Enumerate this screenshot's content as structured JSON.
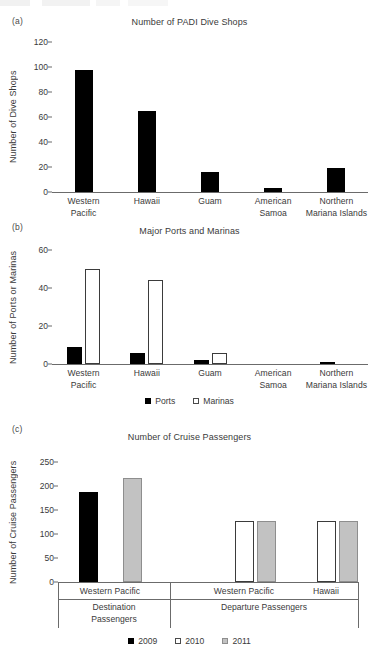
{
  "figure": {
    "panels": [
      {
        "letter": "(a)",
        "title": "Number of PADI Dive Shops",
        "ylabel": "Number of Dive Shops"
      },
      {
        "letter": "(b)",
        "title": "Major Ports and Marinas",
        "ylabel": "Number of Ports or Marinas"
      },
      {
        "letter": "(c)",
        "title": "Number of Cruise Passengers",
        "ylabel": "Number of Cruise Passengers"
      }
    ]
  },
  "chart_data": [
    {
      "panel": "(a)",
      "type": "bar",
      "title": "Number of PADI Dive Shops",
      "xlabel": "",
      "ylabel": "Number of Dive Shops",
      "ylim": [
        0,
        120
      ],
      "yticks": [
        0,
        20,
        40,
        60,
        80,
        100,
        120
      ],
      "grid": false,
      "legend": null,
      "categories": [
        "Western Pacific",
        "Hawaii",
        "Guam",
        "American Samoa",
        "Northern Mariana Islands"
      ],
      "category_lines": [
        [
          "Western",
          "Pacific"
        ],
        [
          "Hawaii",
          ""
        ],
        [
          "Guam",
          ""
        ],
        [
          "American",
          "Samoa"
        ],
        [
          "Northern",
          "Mariana Islands"
        ]
      ],
      "series": [
        {
          "name": "Dive shops",
          "style": "solid",
          "values": [
            98,
            65,
            16,
            3,
            19
          ]
        }
      ]
    },
    {
      "panel": "(b)",
      "type": "bar",
      "title": "Major Ports and Marinas",
      "xlabel": "",
      "ylabel": "Number of Ports or Marinas",
      "ylim": [
        0,
        60
      ],
      "yticks": [
        0,
        20,
        40,
        60
      ],
      "grid": false,
      "legend_position": "bottom",
      "categories": [
        "Western Pacific",
        "Hawaii",
        "Guam",
        "American Samoa",
        "Northern Mariana Islands"
      ],
      "category_lines": [
        [
          "Western",
          "Pacific"
        ],
        [
          "Hawaii",
          ""
        ],
        [
          "Guam",
          ""
        ],
        [
          "American",
          "Samoa"
        ],
        [
          "Northern",
          "Mariana Islands"
        ]
      ],
      "series": [
        {
          "name": "Ports",
          "style": "solid",
          "values": [
            9,
            6,
            2,
            0,
            1
          ]
        },
        {
          "name": "Marinas",
          "style": "open",
          "values": [
            50,
            44,
            6,
            0,
            0
          ]
        }
      ]
    },
    {
      "panel": "(c)",
      "type": "bar",
      "title": "Number of Cruise Passengers",
      "xlabel": "",
      "ylabel": "Number of Cruise Passengers",
      "ylim": [
        0,
        250
      ],
      "yticks": [
        0,
        50,
        100,
        150,
        200,
        250
      ],
      "grid": false,
      "legend_position": "bottom",
      "categories": [
        "Western Pacific",
        "Western Pacific",
        "Hawaii"
      ],
      "groups": [
        {
          "label": "Destination Passengers",
          "label_lines": [
            "Destination",
            "Passengers"
          ],
          "categories": [
            "Western Pacific"
          ]
        },
        {
          "label": "Departure Passengers",
          "label_lines": [
            "Departure Passengers",
            ""
          ],
          "categories": [
            "Western Pacific",
            "Hawaii"
          ]
        }
      ],
      "series": [
        {
          "name": "2009",
          "style": "solid",
          "values": [
            188,
            null,
            null
          ]
        },
        {
          "name": "2010",
          "style": "open",
          "values": [
            null,
            127,
            127
          ]
        },
        {
          "name": "2011",
          "style": "gray",
          "values": [
            217,
            127,
            127
          ]
        }
      ]
    }
  ],
  "legends": {
    "panel_b": [
      {
        "label": "Ports",
        "style": "solid"
      },
      {
        "label": "Marinas",
        "style": "open"
      }
    ],
    "panel_c": [
      {
        "label": "2009",
        "style": "solid"
      },
      {
        "label": "2010",
        "style": "open"
      },
      {
        "label": "2011",
        "style": "gray"
      }
    ]
  },
  "colors": {
    "solid": "#000000",
    "open_fill": "#ffffff",
    "open_stroke": "#3b3b3b",
    "gray_fill": "#c2c2c2",
    "gray_stroke": "#8e8e8e",
    "axis": "#6b6b6b",
    "text": "#3a3a3a",
    "background": "#ffffff"
  }
}
